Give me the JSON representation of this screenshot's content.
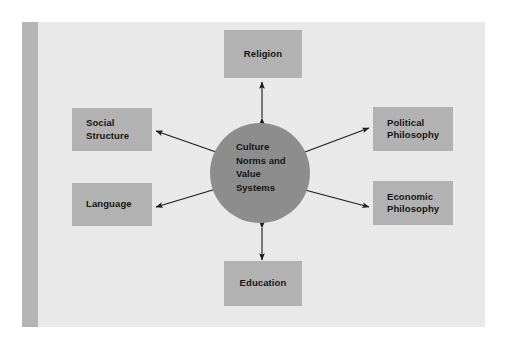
{
  "figure": {
    "background_color": "#e9e9e9",
    "page_color": "#ffffff",
    "spine_bar_color": "#b4b4b4",
    "box_color": "#b2b2b2",
    "circle_color": "#8d8d8d",
    "text_color": "#151515",
    "arrow_color": "#1a1a1a"
  },
  "diagram": {
    "type": "hub-and-spoke",
    "center": {
      "label": "Culture\nNorms and\nValue\nSystems",
      "lines": [
        "Culture",
        "Norms and",
        "Value",
        "Systems"
      ],
      "shape": "circle"
    },
    "nodes": [
      {
        "id": "religion",
        "label": "Religion",
        "lines": [
          "Religion"
        ],
        "position": "top"
      },
      {
        "id": "political",
        "label": "Political\nPhilosophy",
        "lines": [
          "Political",
          "Philosophy"
        ],
        "position": "right-upper"
      },
      {
        "id": "economic",
        "label": "Economic\nPhilosophy",
        "lines": [
          "Economic",
          "Philosophy"
        ],
        "position": "right-lower"
      },
      {
        "id": "education",
        "label": "Education",
        "lines": [
          "Education"
        ],
        "position": "bottom"
      },
      {
        "id": "language",
        "label": "Language",
        "lines": [
          "Language"
        ],
        "position": "left-lower"
      },
      {
        "id": "social",
        "label": "Social\nStructure",
        "lines": [
          "Social",
          "Structure"
        ],
        "position": "left-upper"
      }
    ],
    "connectors": [
      {
        "from": "center",
        "to": "religion",
        "style": "double-headed-arrow"
      },
      {
        "from": "center",
        "to": "political",
        "style": "double-headed-arrow"
      },
      {
        "from": "center",
        "to": "economic",
        "style": "double-headed-arrow"
      },
      {
        "from": "center",
        "to": "education",
        "style": "double-headed-arrow"
      },
      {
        "from": "center",
        "to": "language",
        "style": "double-headed-arrow"
      },
      {
        "from": "center",
        "to": "social",
        "style": "double-headed-arrow"
      }
    ]
  }
}
